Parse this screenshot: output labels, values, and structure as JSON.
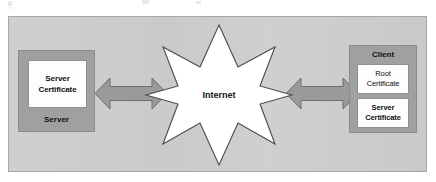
{
  "diagram": {
    "panel": {
      "background_color": "#cdcdcd",
      "border_color": "#a8a8a8"
    },
    "server": {
      "label": "Server",
      "certificate": {
        "line1": "Server",
        "line2": "Certificate"
      },
      "box_color": "#a0a0a0",
      "card_color": "#fdfdfd"
    },
    "client": {
      "label": "Client",
      "root_certificate": {
        "line1": "Root",
        "line2": "Certificate"
      },
      "server_certificate": {
        "line1": "Server",
        "line2": "Certificate"
      },
      "box_color": "#a0a0a0",
      "card_color": "#fdfdfd"
    },
    "internet": {
      "label": "Internet",
      "shape": "eight-point-starburst",
      "fill_color": "#ffffff",
      "outline_color": "#3a3a3a"
    },
    "connectors": [
      {
        "name": "server-to-internet",
        "type": "double-headed-arrow",
        "from": "Server",
        "to": "Internet",
        "fill_color": "#9a9a9a"
      },
      {
        "name": "internet-to-client",
        "type": "double-headed-arrow",
        "from": "Internet",
        "to": "Client",
        "fill_color": "#9a9a9a"
      }
    ]
  }
}
